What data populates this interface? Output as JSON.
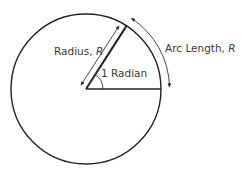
{
  "diagram": {
    "labels": {
      "radius_text": "Radius, ",
      "radius_var": "R",
      "angle_text": "1 Radian",
      "arc_text": "Arc Length, ",
      "arc_var": "R"
    },
    "geometry": {
      "center": [
        86,
        89
      ],
      "radius": 75,
      "angle_radians": 1
    },
    "colors": {
      "stroke": "#222222",
      "text": "#3a3a3a",
      "background": "#ffffff"
    }
  }
}
